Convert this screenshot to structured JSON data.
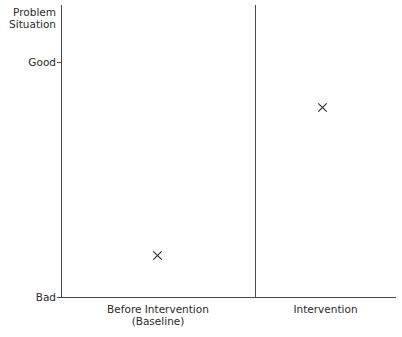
{
  "chart_data": {
    "type": "scatter",
    "title": "",
    "subtitle": "",
    "ylabel": "Problem Situation",
    "ylabel_line1": "Problem",
    "ylabel_line2": "Situation",
    "xlabel": "",
    "grid": false,
    "legend": "none",
    "marker_symbol": "x",
    "marker_color": "#2b2b2b",
    "axis_color": "#4a4a4a",
    "ytick_labels": [
      "Good",
      "Bad"
    ],
    "ylim_labels": [
      "Bad",
      "Good"
    ],
    "phases": [
      {
        "name": "Before Intervention",
        "sublabel": "(Baseline)"
      },
      {
        "name": "Intervention",
        "sublabel": ""
      }
    ],
    "categories": [
      "Before Intervention (Baseline)",
      "Intervention"
    ],
    "points": [
      {
        "phase": "Before Intervention (Baseline)",
        "value_label": "near Bad",
        "x_px": 157,
        "y_px": 255
      },
      {
        "phase": "Intervention",
        "value_label": "near Good",
        "x_px": 322,
        "y_px": 107
      }
    ],
    "series": [
      {
        "name": "Problem Situation rating",
        "values": [
          0.18,
          0.81
        ]
      }
    ],
    "annotations": []
  },
  "axis": {
    "y_top_label_line1": "Problem",
    "y_top_label_line2": "Situation",
    "y_good": "Good",
    "y_bad": "Bad",
    "x_left_line1": "Before Intervention",
    "x_left_line2": "(Baseline)",
    "x_right_line1": "Intervention",
    "x_right_line2": ""
  }
}
